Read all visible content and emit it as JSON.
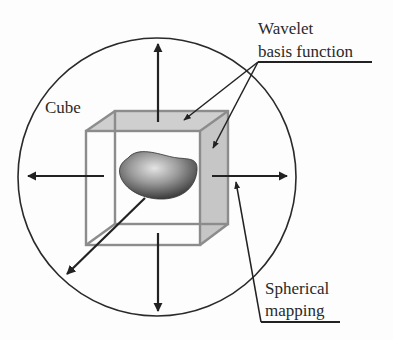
{
  "diagram": {
    "labels": {
      "cube": "Cube",
      "wavelet_line1": "Wavelet",
      "wavelet_line2": "basis function",
      "spherical_line1": "Spherical",
      "spherical_line2": "mapping"
    },
    "components": [
      {
        "id": "sphere",
        "shape": "circle",
        "description": "Outer circle representing the sphere"
      },
      {
        "id": "cube",
        "shape": "wireframe cube",
        "description": "Cube with shaded top and right faces"
      },
      {
        "id": "object",
        "shape": "kidney bean",
        "description": "3D shaded object inside the cube"
      },
      {
        "id": "arrows",
        "count": 5,
        "directions": [
          "up",
          "down",
          "left",
          "right",
          "down-left"
        ]
      }
    ],
    "colors": {
      "line": "#222222",
      "cube_edge": "#8a8a8a",
      "face_fill": "#c8c8c8",
      "bean_dark": "#3a3a3a",
      "bean_light": "#d8d8d8"
    }
  }
}
